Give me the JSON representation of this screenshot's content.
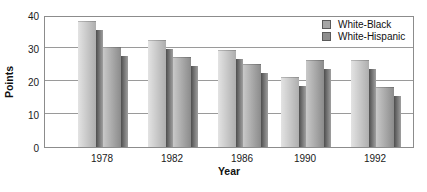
{
  "chart_data": {
    "type": "bar",
    "title": "",
    "xlabel": "Year",
    "ylabel": "Points",
    "categories": [
      "1978",
      "1982",
      "1986",
      "1990",
      "1992"
    ],
    "series": [
      {
        "name": "White-Black",
        "values": [
          38,
          32,
          29,
          21,
          26
        ],
        "bar_color_left": "#e3e3e3",
        "bar_color_right": "#aeaeae",
        "legend_color": "#a6a6a6"
      },
      {
        "name": "White-Hispanic",
        "values": [
          30,
          27,
          25,
          26,
          18
        ],
        "bar_color_left": "#c9c9c9",
        "bar_color_right": "#8b8b8b",
        "legend_color": "#8d8d8d"
      }
    ],
    "ylim": [
      0,
      40
    ],
    "yticks": [
      0,
      10,
      20,
      30,
      40
    ],
    "grid": true,
    "legend_position": "top-right",
    "style": {
      "shadow_color_dark": "#4e4e4e",
      "shadow_color_light": "#a0a0a0",
      "frame_color": "#8c8c8c",
      "grid_color": "#9a9a9a",
      "text_color": "#1a1a1a"
    }
  }
}
